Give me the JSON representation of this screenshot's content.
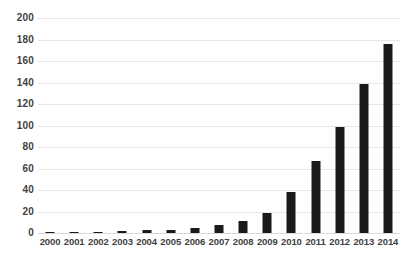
{
  "chart_data": {
    "type": "bar",
    "title": "",
    "subtitle": "",
    "xlabel": "",
    "ylabel": "",
    "categories": [
      "2000",
      "2001",
      "2002",
      "2003",
      "2004",
      "2005",
      "2006",
      "2007",
      "2008",
      "2009",
      "2010",
      "2011",
      "2012",
      "2013",
      "2014"
    ],
    "values": [
      1,
      1,
      1,
      2,
      3,
      3,
      5,
      7,
      11,
      19,
      38,
      67,
      99,
      139,
      176
    ],
    "series": [
      {
        "name": "",
        "values": [
          1,
          1,
          1,
          2,
          3,
          3,
          5,
          7,
          11,
          19,
          38,
          67,
          99,
          139,
          176
        ]
      }
    ],
    "ylim": [
      0,
      200
    ],
    "yticks": [
      0,
      20,
      40,
      60,
      80,
      100,
      120,
      140,
      160,
      180,
      200
    ],
    "ytick_labels": [
      "0",
      "20",
      "40",
      "60",
      "80",
      "100",
      "120",
      "140",
      "160",
      "180",
      "200"
    ],
    "grid": true,
    "grid_axis": "y",
    "legend": false,
    "legend_position": "none",
    "annotations": [],
    "colors": {
      "bar": "#1a1a1a",
      "gridline": "#e6e6e6",
      "baseline": "#d9d9d9",
      "tick_label": "#3f3f3f",
      "background": "#ffffff"
    }
  }
}
